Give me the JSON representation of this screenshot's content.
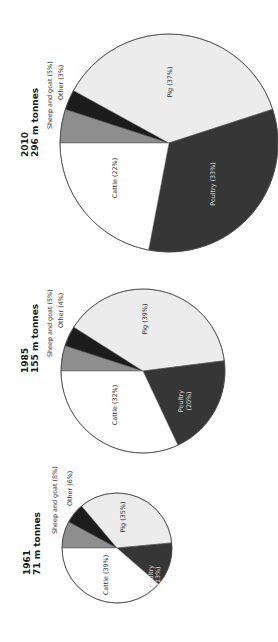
{
  "figure": {
    "orientation": "rotated-90-ccw",
    "categories": [
      "Sheep and goat",
      "Other",
      "Pig",
      "Poultry",
      "Cattle"
    ],
    "colors": {
      "Sheep and goat": "#8e8e8e",
      "Other": "#1c1c1c",
      "Pig": "#ececec",
      "Poultry": "#363636",
      "Cattle": "#ffffff"
    }
  },
  "chart_data": [
    {
      "type": "pie",
      "title": "2010",
      "subtitle": "296 m tonnes",
      "categories": [
        "Sheep and goat",
        "Other",
        "Pig",
        "Poultry",
        "Cattle"
      ],
      "values": [
        5,
        3,
        37,
        33,
        22
      ],
      "labels": [
        "Sheep and goat (5%)",
        "Other (3%)",
        "Pig (37%)",
        "Poultry (33%)",
        "Cattle (22%)"
      ],
      "layout": {
        "cx": 169,
        "cy": 143,
        "r": 109
      }
    },
    {
      "type": "pie",
      "title": "1985",
      "subtitle": "155 m tonnes",
      "categories": [
        "Sheep and goat",
        "Other",
        "Pig",
        "Poultry",
        "Cattle"
      ],
      "values": [
        5,
        4,
        39,
        20,
        32
      ],
      "labels": [
        "Sheep and goat (5%)",
        "Other (4%)",
        "Pig (39%)",
        "Poultry (20%)",
        "Cattle (32%)"
      ],
      "layout": {
        "cx": 143,
        "cy": 371,
        "r": 82
      }
    },
    {
      "type": "pie",
      "title": "1961",
      "subtitle": "71 m tonnes",
      "categories": [
        "Sheep and goat",
        "Other",
        "Pig",
        "Poultry",
        "Cattle"
      ],
      "values": [
        8,
        6,
        35,
        13,
        39
      ],
      "labels": [
        "Sheep and goat (8%)",
        "Other (6%)",
        "Pig (35%)",
        "Poultry (13%)",
        "Cattle (39%)"
      ],
      "layout": {
        "cx": 117,
        "cy": 548,
        "r": 55
      }
    }
  ],
  "charts": {
    "c2010": {
      "year": "2010",
      "total": "296 m tonnes",
      "labels": {
        "sheep": "Sheep and goat (5%)",
        "other": "Other (3%)",
        "pig": "Pig (37%)",
        "poultry": "Poultry (33%)",
        "cattle": "Cattle (22%)"
      }
    },
    "c1985": {
      "year": "1985",
      "total": "155 m tonnes",
      "labels": {
        "sheep": "Sheep and goat (5%)",
        "other": "Other (4%)",
        "pig": "Pig (39%)",
        "poultry_line1": "Poultry",
        "poultry_line2": "(20%)",
        "cattle": "Cattle (32%)"
      }
    },
    "c1961": {
      "year": "1961",
      "total": "71 m tonnes",
      "labels": {
        "sheep": "Sheep and goat (8%)",
        "other": "Other (6%)",
        "pig": "Pig (35%)",
        "poultry_line1": "Poultry",
        "poultry_line2": "(13%)",
        "cattle": "Cattle (39%)"
      }
    }
  }
}
